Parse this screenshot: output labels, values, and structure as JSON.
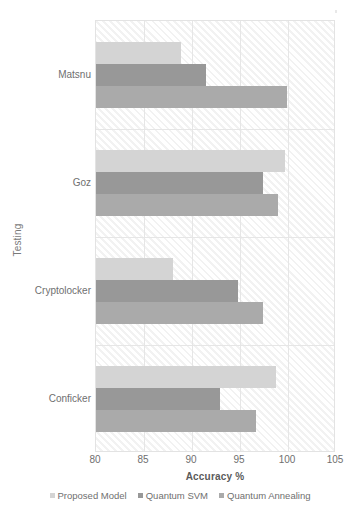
{
  "chart_data": {
    "type": "bar",
    "orientation": "horizontal",
    "title": "",
    "xlabel": "Accuracy %",
    "ylabel": "Testing",
    "xlim": [
      80,
      105
    ],
    "xticks": [
      80,
      85,
      90,
      95,
      100,
      105
    ],
    "grid": true,
    "legend_position": "bottom",
    "categories": [
      "Matsnu",
      "Goz",
      "Cryptolocker",
      "Conficker"
    ],
    "series": [
      {
        "name": "Proposed Model",
        "color": "#d4d4d4",
        "values": [
          88.9,
          99.7,
          88.0,
          98.7
        ]
      },
      {
        "name": "Quantum SVM",
        "color": "#989898",
        "values": [
          91.5,
          97.4,
          94.8,
          92.9
        ]
      },
      {
        "name": "Quantum Annealing",
        "color": "#aaaaaa",
        "values": [
          99.9,
          99.0,
          97.4,
          96.7
        ]
      }
    ]
  },
  "axes": {
    "y_title": "Testing",
    "x_title": "Accuracy %"
  }
}
